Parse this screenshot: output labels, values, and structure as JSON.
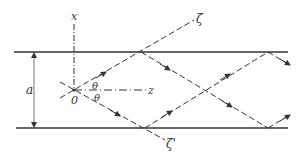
{
  "figure": {
    "labels": {
      "x_axis": "x",
      "z_axis": "z",
      "zeta": "ζ",
      "zeta_prime": "ζ'",
      "origin": "0",
      "theta_upper": "θ",
      "theta_lower": "θ",
      "separation": "a"
    },
    "colors": {
      "line": "#333333",
      "background": "#ffffff"
    }
  }
}
